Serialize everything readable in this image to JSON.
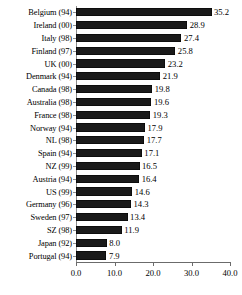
{
  "chart_data": {
    "type": "bar",
    "orientation": "horizontal",
    "title": "",
    "subtitle": "",
    "xlabel": "",
    "ylabel": "",
    "xlim": [
      0.0,
      40.0
    ],
    "xticks": [
      "0.0",
      "10.0",
      "20.0",
      "30.0",
      "40.0"
    ],
    "xtick_values": [
      0.0,
      10.0,
      20.0,
      30.0,
      40.0
    ],
    "grid": false,
    "legend": null,
    "bar_color": "#1a1a1a",
    "value_label_format": "one-decimal",
    "categories": [
      "Belgium (94)",
      "Ireland (00)",
      "Italy (98)",
      "Finland (97)",
      "UK (00)",
      "Denmark (94)",
      "Canada (98)",
      "Australia (98)",
      "France (98)",
      "Norway (94)",
      "NL (98)",
      "Spain (94)",
      "NZ (99)",
      "Austria (94)",
      "US (99)",
      "Germany (96)",
      "Sweden (97)",
      "SZ (98)",
      "Japan (92)",
      "Portugal (94)"
    ],
    "values": [
      35.2,
      28.9,
      27.4,
      25.8,
      23.2,
      21.9,
      19.8,
      19.6,
      19.3,
      17.9,
      17.7,
      17.1,
      16.5,
      16.4,
      14.6,
      14.3,
      13.4,
      11.9,
      8.0,
      7.9
    ],
    "value_labels": [
      "35.2",
      "28.9",
      "27.4",
      "25.8",
      "23.2",
      "21.9",
      "19.8",
      "19.6",
      "19.3",
      "17.9",
      "17.7",
      "17.1",
      "16.5",
      "16.4",
      "14.6",
      "14.3",
      "13.4",
      "11.9",
      "8.0",
      "7.9"
    ]
  }
}
